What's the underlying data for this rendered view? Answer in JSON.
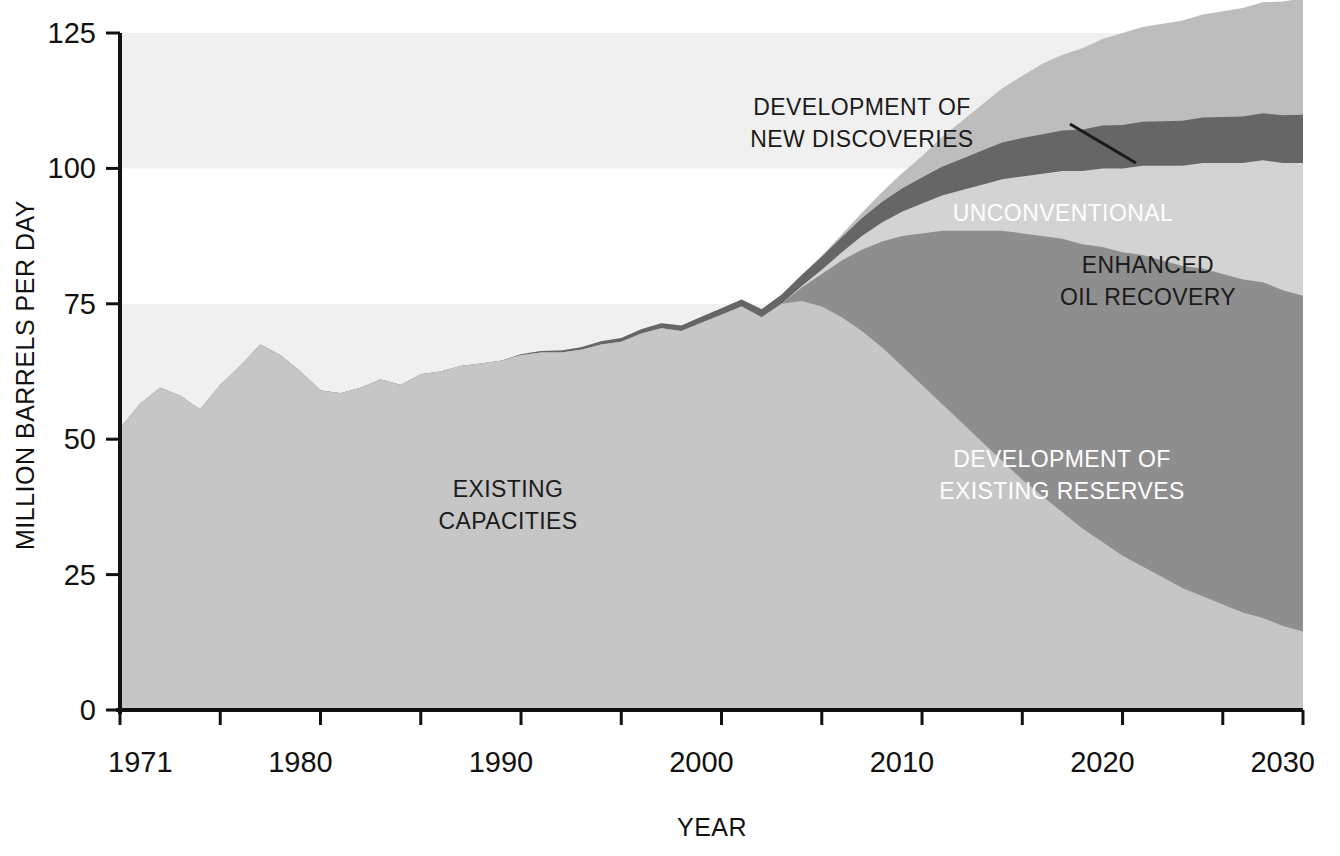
{
  "chart_data": {
    "type": "area",
    "title": "",
    "subtitle": "",
    "xlabel": "YEAR",
    "ylabel": "MILLION BARRELS PER DAY",
    "xlim": [
      1971,
      2030
    ],
    "ylim": [
      0,
      125
    ],
    "ytick_labels": [
      "0",
      "25",
      "50",
      "75",
      "100",
      "125"
    ],
    "ytick_values": [
      0,
      25,
      50,
      75,
      100,
      125
    ],
    "xtick_labels": [
      "1971",
      "1980",
      "1990",
      "2000",
      "2010",
      "2020",
      "2030"
    ],
    "xtick_values": [
      1971,
      1980,
      1990,
      2000,
      2010,
      2020,
      2030
    ],
    "xminor_step": 5,
    "grid": false,
    "legend_position": "inline-annotations",
    "stacking": "stacked-area",
    "x": [
      1971,
      1972,
      1973,
      1974,
      1975,
      1976,
      1977,
      1978,
      1979,
      1980,
      1981,
      1982,
      1983,
      1984,
      1985,
      1986,
      1987,
      1988,
      1989,
      1990,
      1991,
      1992,
      1993,
      1994,
      1995,
      1996,
      1997,
      1998,
      1999,
      2000,
      2001,
      2002,
      2003,
      2004,
      2005,
      2006,
      2007,
      2008,
      2009,
      2010,
      2011,
      2012,
      2013,
      2014,
      2015,
      2016,
      2017,
      2018,
      2019,
      2020,
      2021,
      2022,
      2023,
      2024,
      2025,
      2026,
      2027,
      2028,
      2029,
      2030
    ],
    "series": [
      {
        "name": "EXISTING CAPACITIES",
        "color": "#c6c6c6",
        "values": [
          52.0,
          56.5,
          59.5,
          58.0,
          55.5,
          60.0,
          63.5,
          67.5,
          65.5,
          62.5,
          59.0,
          58.5,
          59.5,
          61.0,
          60.0,
          62.0,
          62.5,
          63.5,
          64.0,
          64.5,
          65.5,
          66.0,
          66.0,
          66.5,
          67.5,
          68.0,
          69.5,
          70.5,
          70.0,
          71.5,
          73.0,
          74.5,
          72.5,
          75.0,
          75.5,
          74.5,
          72.5,
          70.0,
          67.0,
          63.5,
          60.0,
          56.5,
          53.0,
          49.5,
          46.0,
          42.5,
          39.5,
          36.5,
          33.5,
          31.0,
          28.5,
          26.5,
          24.5,
          22.5,
          21.0,
          19.5,
          18.0,
          17.0,
          15.5,
          14.5
        ]
      },
      {
        "name": "DEVELOPMENT OF EXISTING RESERVES",
        "color": "#8e8e8e",
        "values": [
          0,
          0,
          0,
          0,
          0,
          0,
          0,
          0,
          0,
          0,
          0,
          0,
          0,
          0,
          0,
          0,
          0,
          0,
          0,
          0,
          0,
          0,
          0,
          0,
          0,
          0,
          0,
          0,
          0,
          0,
          0,
          0,
          0,
          0.0,
          2.5,
          6.0,
          10.5,
          15.0,
          19.5,
          24.0,
          28.0,
          32.0,
          35.5,
          39.0,
          42.5,
          45.5,
          48.0,
          50.5,
          52.5,
          54.5,
          56.0,
          57.5,
          58.5,
          59.5,
          60.5,
          61.0,
          61.5,
          62.0,
          62.0,
          62.0
        ]
      },
      {
        "name": "ENHANCED OIL RECOVERY",
        "color": "#d3d3d3",
        "values": [
          0,
          0,
          0,
          0,
          0,
          0,
          0,
          0,
          0,
          0,
          0,
          0,
          0,
          0,
          0,
          0,
          0,
          0,
          0,
          0,
          0,
          0,
          0,
          0,
          0,
          0,
          0,
          0,
          0,
          0,
          0,
          0,
          0,
          0.0,
          0.3,
          0.8,
          1.5,
          2.5,
          3.5,
          4.5,
          5.5,
          6.5,
          7.5,
          8.5,
          9.5,
          10.5,
          11.5,
          12.5,
          13.5,
          14.5,
          15.5,
          16.5,
          17.5,
          18.5,
          19.5,
          20.5,
          21.5,
          22.5,
          23.5,
          24.5
        ]
      },
      {
        "name": "UNCONVENTIONAL",
        "color": "#666666",
        "values": [
          0,
          0,
          0,
          0,
          0,
          0,
          0,
          0,
          0,
          0,
          0,
          0,
          0,
          0,
          0,
          0,
          0,
          0,
          0,
          0,
          0.2,
          0.3,
          0.4,
          0.5,
          0.6,
          0.7,
          0.8,
          0.9,
          1.0,
          1.1,
          1.2,
          1.3,
          1.5,
          1.7,
          2.0,
          2.4,
          2.8,
          3.3,
          3.8,
          4.3,
          4.8,
          5.3,
          5.8,
          6.3,
          6.8,
          7.1,
          7.3,
          7.5,
          7.7,
          7.9,
          8.0,
          8.1,
          8.2,
          8.3,
          8.4,
          8.5,
          8.6,
          8.7,
          8.8,
          8.9
        ]
      },
      {
        "name": "DEVELOPMENT OF NEW DISCOVERIES",
        "color": "#bdbdbd",
        "values": [
          0,
          0,
          0,
          0,
          0,
          0,
          0,
          0,
          0,
          0,
          0,
          0,
          0,
          0,
          0,
          0,
          0,
          0,
          0,
          0,
          0,
          0,
          0,
          0,
          0,
          0,
          0,
          0,
          0,
          0,
          0,
          0,
          0,
          0.0,
          0.0,
          0.2,
          0.5,
          1.0,
          1.8,
          2.8,
          4.0,
          5.5,
          7.0,
          8.5,
          10.0,
          11.5,
          13.0,
          14.0,
          15.0,
          16.0,
          17.0,
          17.5,
          18.0,
          18.5,
          19.0,
          19.5,
          20.0,
          20.5,
          21.0,
          21.5
        ]
      }
    ],
    "annotations": [
      {
        "id": "existing-capacities",
        "text_lines": [
          "EXISTING",
          "CAPACITIES"
        ],
        "color": "#1a1a1a",
        "x_px": 508,
        "y_px": 497
      },
      {
        "id": "development-new-discoveries",
        "text_lines": [
          "DEVELOPMENT OF",
          "NEW DISCOVERIES"
        ],
        "color": "#1a1a1a",
        "x_px": 862,
        "y_px": 115,
        "leader": true
      },
      {
        "id": "unconventional",
        "text_lines": [
          "UNCONVENTIONAL"
        ],
        "color": "#ffffff",
        "x_px": 1063,
        "y_px": 221
      },
      {
        "id": "enhanced-oil-recovery",
        "text_lines": [
          "ENHANCED",
          "OIL RECOVERY"
        ],
        "color": "#1a1a1a",
        "x_px": 1148,
        "y_px": 273
      },
      {
        "id": "development-existing-reserves",
        "text_lines": [
          "DEVELOPMENT OF",
          "EXISTING RESERVES"
        ],
        "color": "#ffffff",
        "x_px": 1062,
        "y_px": 467
      }
    ],
    "band_shading": {
      "enabled": true,
      "color": "#f0f0f0",
      "bands": [
        [
          0,
          25
        ],
        [
          50,
          75
        ],
        [
          100,
          125
        ]
      ]
    },
    "axis_color": "#111111",
    "background_color": "#ffffff"
  }
}
